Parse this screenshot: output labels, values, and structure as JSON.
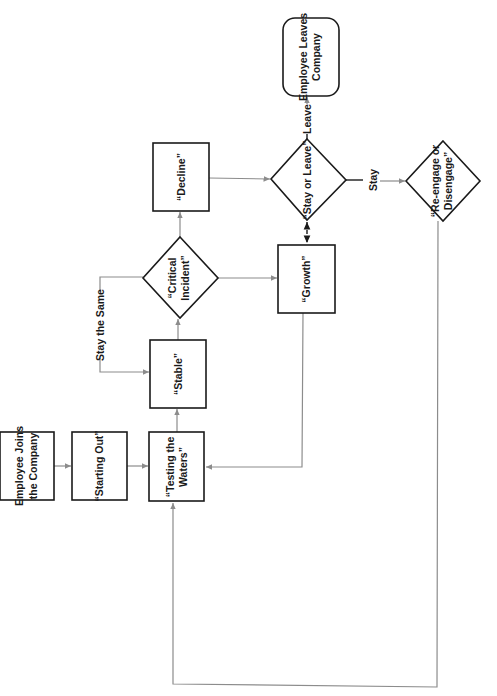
{
  "diagram": {
    "orientation": "rotated-90-ccw",
    "colors": {
      "node_stroke": "#1a1a1a",
      "edge_stroke": "#8c8c8c",
      "background": "#ffffff"
    },
    "nodes": {
      "joins": {
        "shape": "rectangle",
        "line1": "Employee Joins",
        "line2": "the Company"
      },
      "starting_out": {
        "shape": "rectangle",
        "line1": "“Starting Out”"
      },
      "testing_waters": {
        "shape": "rectangle",
        "line1": "“Testing the",
        "line2": "Waters”"
      },
      "stable": {
        "shape": "rectangle",
        "line1": "“Stable”"
      },
      "critical_incident": {
        "shape": "diamond",
        "line1": "“Critical",
        "line2": "Incident”"
      },
      "decline": {
        "shape": "rectangle",
        "line1": "“Decline”"
      },
      "growth": {
        "shape": "rectangle",
        "line1": "“Growth”"
      },
      "stay_or_leave": {
        "shape": "diamond",
        "line1": "“Stay or Leave”"
      },
      "leaves": {
        "shape": "rounded-rectangle",
        "line1": "Employee Leaves",
        "line2": "Company"
      },
      "reengage": {
        "shape": "diamond",
        "line1": "“Re-engage or",
        "line2": "Disengage”"
      }
    },
    "edge_labels": {
      "stay_the_same": "Stay the Same",
      "leave": "Leave",
      "stay": "Stay"
    },
    "edges": [
      {
        "from": "joins",
        "to": "starting_out"
      },
      {
        "from": "starting_out",
        "to": "testing_waters"
      },
      {
        "from": "testing_waters",
        "to": "stable"
      },
      {
        "from": "stable",
        "to": "critical_incident"
      },
      {
        "from": "critical_incident",
        "to": "stable",
        "label": "Stay the Same"
      },
      {
        "from": "critical_incident",
        "to": "decline"
      },
      {
        "from": "critical_incident",
        "to": "growth"
      },
      {
        "from": "decline",
        "to": "stay_or_leave"
      },
      {
        "from": "stay_or_leave",
        "to": "growth",
        "style": "dashed",
        "bidirectional": true
      },
      {
        "from": "stay_or_leave",
        "to": "leaves",
        "label": "Leave"
      },
      {
        "from": "stay_or_leave",
        "to": "reengage",
        "label": "Stay"
      },
      {
        "from": "growth",
        "to": "testing_waters"
      },
      {
        "from": "reengage",
        "to": "testing_waters"
      }
    ]
  }
}
